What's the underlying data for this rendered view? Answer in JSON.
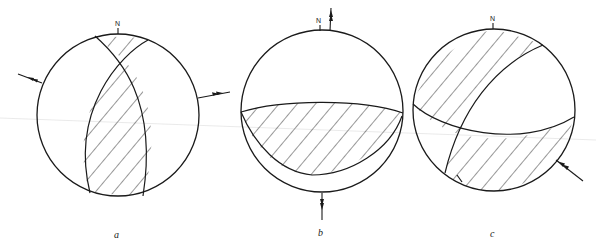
{
  "figure": {
    "type": "focal-mechanism stereonet diagrams",
    "panels": [
      {
        "id": "a",
        "label": "a",
        "north_label": "N",
        "arrows": [
          "left arrow pointing outward (upper-left)",
          "right arrow pointing outward (right)"
        ]
      },
      {
        "id": "b",
        "label": "b",
        "north_label": "N",
        "arrows": [
          "top arrow pointing up (north)",
          "bottom arrow pointing down (south)"
        ]
      },
      {
        "id": "c",
        "label": "c",
        "north_label": "N",
        "arrows": [
          "lower-right arrow pointing inward (toward center)"
        ]
      }
    ]
  },
  "colors": {
    "ink": "#1a1a1a",
    "background": "#ffffff"
  }
}
